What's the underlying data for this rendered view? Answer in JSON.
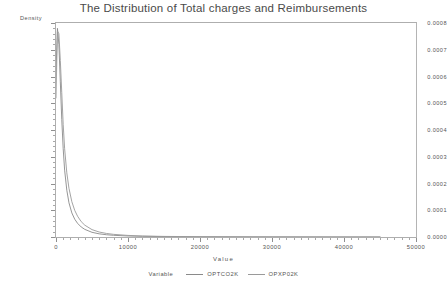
{
  "title": "The Distribution of Total charges and Reimbursements",
  "axis": {
    "ylabel": "Density",
    "xlabel": "Value"
  },
  "legend": {
    "title": "Variable",
    "entries": [
      {
        "label": "OPTCO2K",
        "color": "#8a8a8a"
      },
      {
        "label": "OPXP02K",
        "color": "#9a9a9a"
      }
    ]
  },
  "chart_data": {
    "type": "line",
    "title": "The Distribution of Total charges and Reimbursements",
    "xlabel": "Value",
    "ylabel": "Density",
    "xlim": [
      0,
      50000
    ],
    "ylim": [
      0,
      0.0008
    ],
    "grid": false,
    "legend_position": "bottom",
    "xticks": [
      0,
      10000,
      20000,
      30000,
      40000,
      50000
    ],
    "xtick_labels": [
      "0",
      "10000",
      "20000",
      "30000",
      "40000",
      "50000"
    ],
    "xtick_minor_step": 1000,
    "yticks": [
      0.0,
      0.0001,
      0.0002,
      0.0003,
      0.0004,
      0.0005,
      0.0006,
      0.0007,
      0.0008
    ],
    "ytick_labels": [
      "0.0000",
      "0.0001",
      "0.0002",
      "0.0003",
      "0.0004",
      "0.0005",
      "0.0006",
      "0.0007",
      "0.0008"
    ],
    "series": [
      {
        "name": "OPTCO2K",
        "color": "#8a8a8a",
        "x": [
          0,
          200,
          400,
          600,
          800,
          1000,
          1200,
          1500,
          1800,
          2200,
          2600,
          3000,
          3500,
          4000,
          5000,
          6000,
          7000,
          8000,
          10000,
          12000,
          15000,
          20000,
          25000,
          30000,
          35000,
          40000,
          45000
        ],
        "y": [
          0.00062,
          0.00078,
          0.00072,
          0.00058,
          0.00044,
          0.00033,
          0.00025,
          0.000175,
          0.000128,
          9e-05,
          6.65e-05,
          5.1e-05,
          3.75e-05,
          2.85e-05,
          1.75e-05,
          1.18e-05,
          8.5e-06,
          6.3e-06,
          3.8e-06,
          2.5e-06,
          1.5e-06,
          8e-07,
          5e-07,
          3e-07,
          2e-07,
          1e-07,
          1e-07
        ]
      },
      {
        "name": "OPXP02K",
        "color": "#9a9a9a",
        "x": [
          0,
          200,
          400,
          600,
          800,
          1000,
          1200,
          1500,
          1800,
          2200,
          2600,
          3000,
          3500,
          4000,
          5000,
          6000,
          7000,
          8000,
          10000,
          12000,
          15000,
          20000,
          25000,
          30000,
          35000,
          40000,
          45000
        ],
        "y": [
          0.00052,
          0.00077,
          0.00076,
          0.00066,
          0.00054,
          0.00042,
          0.00033,
          0.00024,
          0.000182,
          0.000132,
          9.95e-05,
          7.75e-05,
          5.75e-05,
          4.42e-05,
          2.75e-05,
          1.86e-05,
          1.33e-05,
          9.9e-06,
          5.9e-06,
          3.8e-06,
          2.2e-06,
          1.2e-06,
          7e-07,
          4e-07,
          3e-07,
          2e-07,
          1e-07
        ]
      }
    ]
  }
}
